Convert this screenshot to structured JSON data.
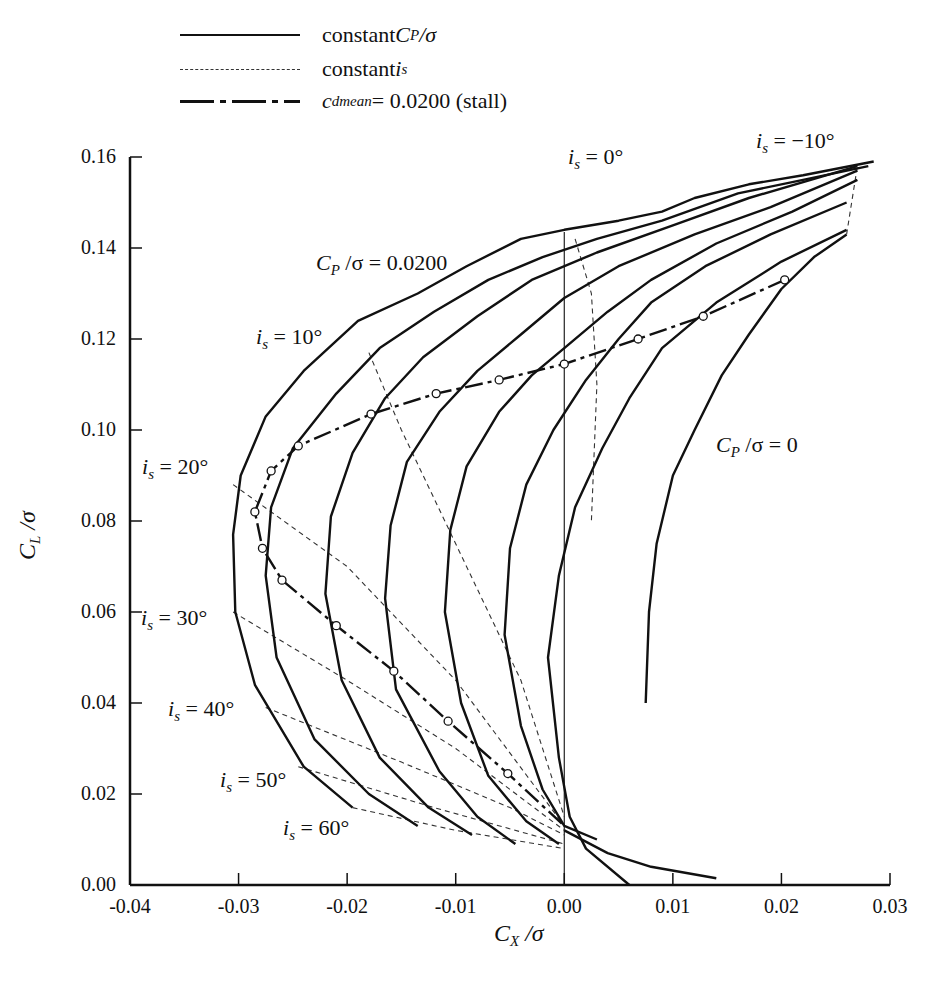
{
  "legend": {
    "items": [
      {
        "style": "solid",
        "label_prefix": "constant ",
        "label_var": "C",
        "label_sub": "P",
        "label_suffix": " /σ"
      },
      {
        "style": "dashed",
        "label_prefix": "constant ",
        "label_var": "i",
        "label_sub": "s",
        "label_suffix": ""
      },
      {
        "style": "dash-dot",
        "label_prefix": "",
        "label_var": "c",
        "label_sub": "dmean",
        "label_suffix": " = 0.0200 (stall)"
      }
    ]
  },
  "axes": {
    "xlabel_var": "C",
    "xlabel_sub": "X",
    "xlabel_suffix": " /σ",
    "ylabel_var": "C",
    "ylabel_sub": "L",
    "ylabel_suffix": " /σ",
    "xticks": [
      "-0.04",
      "-0.03",
      "-0.02",
      "-0.01",
      "0.00",
      "0.01",
      "0.02",
      "0.03"
    ],
    "yticks": [
      "0.00",
      "0.02",
      "0.04",
      "0.06",
      "0.08",
      "0.10",
      "0.12",
      "0.14",
      "0.16"
    ]
  },
  "annotations": {
    "is_neg10": {
      "var": "i",
      "sub": "s",
      "text": " = −10°"
    },
    "is_0": {
      "var": "i",
      "sub": "s",
      "text": " = 0°"
    },
    "is_10": {
      "var": "i",
      "sub": "s",
      "text": " = 10°"
    },
    "is_20": {
      "var": "i",
      "sub": "s",
      "text": " = 20°"
    },
    "is_30": {
      "var": "i",
      "sub": "s",
      "text": " = 30°"
    },
    "is_40": {
      "var": "i",
      "sub": "s",
      "text": " = 40°"
    },
    "is_50": {
      "var": "i",
      "sub": "s",
      "text": " = 50°"
    },
    "is_60": {
      "var": "i",
      "sub": "s",
      "text": " = 60°"
    },
    "cp_0200": {
      "var": "C",
      "sub": "P",
      "text": " /σ = 0.0200"
    },
    "cp_0": {
      "var": "C",
      "sub": "P",
      "text": " /σ = 0"
    }
  },
  "chart_data": {
    "type": "line",
    "title": "",
    "xlabel": "C_X/σ",
    "ylabel": "C_L/σ",
    "xlim": [
      -0.04,
      0.03
    ],
    "ylim": [
      0.0,
      0.16
    ],
    "grid": false,
    "legend_position": "top-left, above plot",
    "legend": [
      "constant C_P/σ",
      "constant i_s",
      "c_dmean = 0.0200 (stall)"
    ],
    "series": [
      {
        "name": "C_P/σ = 0.0200",
        "style": "solid",
        "points": [
          [
            -0.0195,
            0.017
          ],
          [
            -0.024,
            0.026
          ],
          [
            -0.0285,
            0.044
          ],
          [
            -0.0303,
            0.06
          ],
          [
            -0.0305,
            0.077
          ],
          [
            -0.0298,
            0.09
          ],
          [
            -0.0275,
            0.103
          ],
          [
            -0.024,
            0.113
          ],
          [
            -0.019,
            0.124
          ],
          [
            -0.0135,
            0.13
          ],
          [
            -0.009,
            0.136
          ],
          [
            -0.004,
            0.142
          ],
          [
            0.0,
            0.144
          ],
          [
            0.005,
            0.146
          ],
          [
            0.009,
            0.148
          ],
          [
            0.012,
            0.151
          ],
          [
            0.017,
            0.154
          ],
          [
            0.022,
            0.156
          ],
          [
            0.0285,
            0.159
          ]
        ]
      },
      {
        "name": "C_P/σ (2)",
        "style": "solid",
        "points": [
          [
            -0.0135,
            0.013
          ],
          [
            -0.018,
            0.02
          ],
          [
            -0.023,
            0.032
          ],
          [
            -0.0265,
            0.05
          ],
          [
            -0.0275,
            0.068
          ],
          [
            -0.027,
            0.083
          ],
          [
            -0.025,
            0.096
          ],
          [
            -0.021,
            0.108
          ],
          [
            -0.017,
            0.118
          ],
          [
            -0.012,
            0.126
          ],
          [
            -0.007,
            0.133
          ],
          [
            -0.002,
            0.138
          ],
          [
            0.003,
            0.142
          ],
          [
            0.009,
            0.146
          ],
          [
            0.016,
            0.152
          ],
          [
            0.022,
            0.155
          ],
          [
            0.028,
            0.158
          ]
        ]
      },
      {
        "name": "C_P/σ (3)",
        "style": "solid",
        "points": [
          [
            -0.0085,
            0.011
          ],
          [
            -0.0125,
            0.017
          ],
          [
            -0.017,
            0.028
          ],
          [
            -0.0205,
            0.045
          ],
          [
            -0.022,
            0.064
          ],
          [
            -0.0215,
            0.081
          ],
          [
            -0.0195,
            0.095
          ],
          [
            -0.0165,
            0.107
          ],
          [
            -0.013,
            0.116
          ],
          [
            -0.008,
            0.125
          ],
          [
            -0.003,
            0.133
          ],
          [
            0.003,
            0.139
          ],
          [
            0.01,
            0.145
          ],
          [
            0.017,
            0.151
          ],
          [
            0.027,
            0.158
          ]
        ]
      },
      {
        "name": "C_P/σ (4)",
        "style": "solid",
        "points": [
          [
            -0.0045,
            0.009
          ],
          [
            -0.008,
            0.015
          ],
          [
            -0.0115,
            0.025
          ],
          [
            -0.0155,
            0.043
          ],
          [
            -0.0165,
            0.063
          ],
          [
            -0.016,
            0.079
          ],
          [
            -0.0145,
            0.093
          ],
          [
            -0.0115,
            0.104
          ],
          [
            -0.008,
            0.113
          ],
          [
            -0.004,
            0.121
          ],
          [
            0.0,
            0.129
          ],
          [
            0.005,
            0.136
          ],
          [
            0.012,
            0.143
          ],
          [
            0.019,
            0.149
          ],
          [
            0.027,
            0.157
          ]
        ]
      },
      {
        "name": "C_P/σ (5)",
        "style": "solid",
        "points": [
          [
            -0.0005,
            0.009
          ],
          [
            -0.0035,
            0.014
          ],
          [
            -0.007,
            0.024
          ],
          [
            -0.0095,
            0.04
          ],
          [
            -0.011,
            0.06
          ],
          [
            -0.0105,
            0.078
          ],
          [
            -0.009,
            0.092
          ],
          [
            -0.006,
            0.104
          ],
          [
            -0.003,
            0.112
          ],
          [
            0.0,
            0.118
          ],
          [
            0.004,
            0.126
          ],
          [
            0.008,
            0.133
          ],
          [
            0.014,
            0.141
          ],
          [
            0.021,
            0.148
          ],
          [
            0.027,
            0.155
          ]
        ]
      },
      {
        "name": "C_P/σ (6)",
        "style": "solid",
        "points": [
          [
            0.003,
            0.01
          ],
          [
            0.0,
            0.013
          ],
          [
            -0.002,
            0.021
          ],
          [
            -0.004,
            0.035
          ],
          [
            -0.0055,
            0.055
          ],
          [
            -0.005,
            0.074
          ],
          [
            -0.0035,
            0.088
          ],
          [
            -0.001,
            0.1
          ],
          [
            0.002,
            0.111
          ],
          [
            0.005,
            0.12
          ],
          [
            0.008,
            0.128
          ],
          [
            0.013,
            0.136
          ],
          [
            0.019,
            0.143
          ],
          [
            0.026,
            0.15
          ]
        ]
      },
      {
        "name": "C_P/σ (7)",
        "style": "solid",
        "points": [
          [
            0.006,
            0.0
          ],
          [
            0.002,
            0.008
          ],
          [
            0.0005,
            0.015
          ],
          [
            -0.0005,
            0.028
          ],
          [
            -0.0015,
            0.05
          ],
          [
            -0.0005,
            0.068
          ],
          [
            0.001,
            0.083
          ],
          [
            0.0035,
            0.096
          ],
          [
            0.006,
            0.107
          ],
          [
            0.009,
            0.118
          ],
          [
            0.014,
            0.128
          ],
          [
            0.02,
            0.137
          ],
          [
            0.026,
            0.144
          ]
        ]
      },
      {
        "name": "C_P/σ = 0",
        "style": "solid",
        "points": [
          [
            0.0075,
            0.04
          ],
          [
            0.0078,
            0.06
          ],
          [
            0.0085,
            0.075
          ],
          [
            0.01,
            0.09
          ],
          [
            0.012,
            0.1
          ],
          [
            0.0145,
            0.112
          ],
          [
            0.017,
            0.121
          ],
          [
            0.02,
            0.131
          ],
          [
            0.023,
            0.138
          ],
          [
            0.026,
            0.143
          ]
        ]
      },
      {
        "name": "low-lift tails",
        "style": "solid",
        "points": [
          [
            0.0,
            0.012
          ],
          [
            0.004,
            0.007
          ],
          [
            0.008,
            0.004
          ],
          [
            0.014,
            0.0015
          ]
        ]
      }
    ],
    "constant_is_lines": [
      {
        "label": "i_s = -10°",
        "points": [
          [
            0.026,
            0.143
          ],
          [
            0.027,
            0.158
          ]
        ]
      },
      {
        "label": "i_s = 0°",
        "points": [
          [
            0.001,
            0.142
          ],
          [
            0.0025,
            0.13
          ],
          [
            0.003,
            0.11
          ],
          [
            0.0025,
            0.08
          ]
        ]
      },
      {
        "label": "i_s = 10°",
        "points": [
          [
            -0.018,
            0.117
          ],
          [
            -0.015,
            0.1
          ],
          [
            -0.01,
            0.075
          ],
          [
            -0.004,
            0.045
          ],
          [
            0.0,
            0.015
          ]
        ]
      },
      {
        "label": "i_s = 20°",
        "points": [
          [
            -0.0305,
            0.088
          ],
          [
            -0.02,
            0.07
          ],
          [
            -0.01,
            0.045
          ],
          [
            0.0,
            0.013
          ]
        ]
      },
      {
        "label": "i_s = 30°",
        "points": [
          [
            -0.0305,
            0.06
          ],
          [
            -0.02,
            0.045
          ],
          [
            -0.01,
            0.03
          ],
          [
            0.0,
            0.012
          ]
        ]
      },
      {
        "label": "i_s = 40°",
        "points": [
          [
            -0.0275,
            0.039
          ],
          [
            -0.015,
            0.027
          ],
          [
            -0.005,
            0.017
          ],
          [
            0.0,
            0.011
          ]
        ]
      },
      {
        "label": "i_s = 50°",
        "points": [
          [
            -0.0245,
            0.026
          ],
          [
            -0.012,
            0.017
          ],
          [
            0.0,
            0.009
          ]
        ]
      },
      {
        "label": "i_s = 60°",
        "points": [
          [
            -0.0195,
            0.017
          ],
          [
            -0.01,
            0.012
          ],
          [
            0.0,
            0.008
          ]
        ]
      }
    ],
    "stall_line": {
      "label": "c_dmean = 0.0200 (stall)",
      "points": [
        [
          0.0203,
          0.133
        ],
        [
          0.0128,
          0.125
        ],
        [
          0.0068,
          0.12
        ],
        [
          0.0,
          0.1145
        ],
        [
          -0.006,
          0.111
        ],
        [
          -0.0118,
          0.108
        ],
        [
          -0.0178,
          0.1035
        ],
        [
          -0.0245,
          0.0965
        ],
        [
          -0.027,
          0.091
        ],
        [
          -0.0285,
          0.082
        ],
        [
          -0.0278,
          0.074
        ],
        [
          -0.026,
          0.067
        ],
        [
          -0.021,
          0.057
        ],
        [
          -0.0157,
          0.047
        ],
        [
          -0.0107,
          0.036
        ],
        [
          -0.0052,
          0.0245
        ],
        [
          0.0,
          0.013
        ]
      ]
    }
  }
}
